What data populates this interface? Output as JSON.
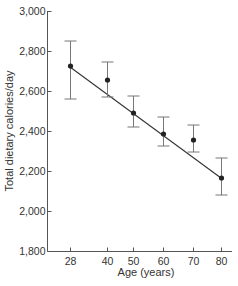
{
  "chart_data": {
    "type": "line",
    "title": "",
    "xlabel": "Age (years)",
    "ylabel": "Total dietary calories/day",
    "x": [
      28,
      40,
      50,
      60,
      70,
      80
    ],
    "x_tick_labels": [
      "28",
      "40",
      "50",
      "60",
      "70",
      "80"
    ],
    "y_tick_labels": [
      "1,800",
      "2,000",
      "2,200",
      "2,400",
      "2,600",
      "2,800",
      "3,000"
    ],
    "y_ticks": [
      1800,
      2000,
      2200,
      2400,
      2600,
      2800,
      3000
    ],
    "ylim": [
      1800,
      3000
    ],
    "grid": false,
    "legend": null,
    "series": [
      {
        "name": "Mean intake",
        "type": "scatter",
        "values": [
          2725,
          2655,
          2490,
          2385,
          2355,
          2165
        ],
        "error_upper": [
          2850,
          2745,
          2575,
          2470,
          2430,
          2265
        ],
        "error_lower": [
          2560,
          2570,
          2420,
          2325,
          2295,
          2080
        ]
      },
      {
        "name": "Regression line",
        "type": "line",
        "x": [
          28,
          80
        ],
        "values": [
          2720,
          2165
        ]
      }
    ]
  },
  "colors": {
    "axis": "#555555",
    "points": "#222222",
    "error_bars": "#777777",
    "line": "#333333"
  }
}
